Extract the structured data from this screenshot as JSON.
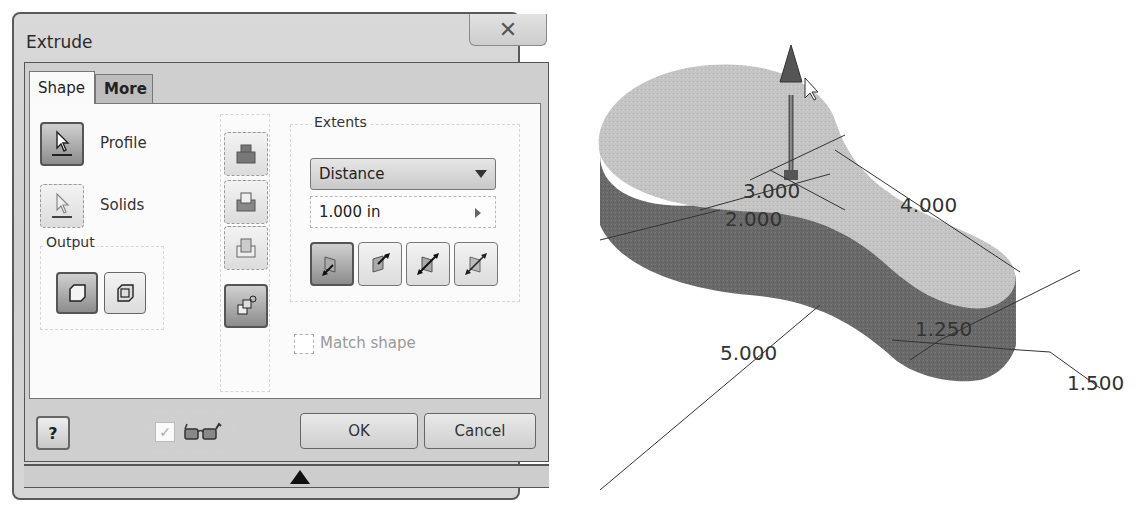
{
  "dialog": {
    "title": "Extrude",
    "close_icon": "close-icon",
    "tabs": [
      {
        "label": "Shape",
        "active": true
      },
      {
        "label": "More",
        "active": false
      }
    ],
    "selection": {
      "profile_label": "Profile",
      "solids_label": "Solids"
    },
    "output": {
      "label": "Output",
      "buttons": [
        {
          "name": "solid-output",
          "pressed": true
        },
        {
          "name": "surface-output",
          "pressed": false
        }
      ]
    },
    "operation_buttons": [
      {
        "name": "join",
        "pressed": false
      },
      {
        "name": "cut",
        "pressed": false
      },
      {
        "name": "intersect",
        "pressed": false
      },
      {
        "name": "new-solid",
        "pressed": true
      }
    ],
    "extents": {
      "label": "Extents",
      "type": "Distance",
      "distance_value": "1.000 in",
      "direction_buttons": [
        {
          "name": "direction-1",
          "pressed": true
        },
        {
          "name": "direction-2",
          "pressed": false
        },
        {
          "name": "symmetric",
          "pressed": false
        },
        {
          "name": "asymmetric",
          "pressed": false
        }
      ]
    },
    "match_shape_label": "Match shape",
    "match_shape_checked": false,
    "preview_checked": true,
    "ok_label": "OK",
    "cancel_label": "Cancel",
    "help_icon": "?"
  },
  "model": {
    "dimensions": {
      "d1": "3.000",
      "d2": "2.000",
      "d3": "4.000",
      "d4": "5.000",
      "d5": "1.250",
      "d6": "1.500"
    }
  }
}
